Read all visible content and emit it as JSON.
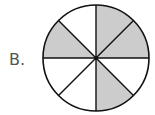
{
  "label": "B.",
  "diagram": {
    "type": "fraction-circle",
    "center": [
      96,
      58
    ],
    "radius": 53,
    "sectors_total": 8,
    "shaded_sectors": [
      0,
      1,
      3,
      6
    ],
    "shaded_fraction": "4/8",
    "colors": {
      "shaded": "#cccccc",
      "unshaded": "#ffffff",
      "stroke": "#111111"
    }
  }
}
